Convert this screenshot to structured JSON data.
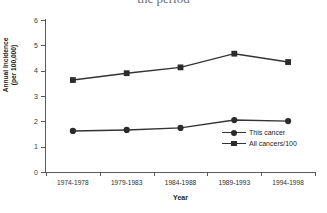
{
  "figure": {
    "title_fragment": "the period",
    "title_note": "cropped at top edge",
    "x_axis_title": "Year",
    "y_axis_title": "Annual Incidence\n(per 100,000)"
  },
  "legend": {
    "position": "inside-lower-right",
    "entries": [
      {
        "label": "This cancer",
        "marker": "circle-marker-icon"
      },
      {
        "label": "All cancers/100",
        "marker": "square-marker-icon"
      }
    ]
  },
  "colors": {
    "line": "#333333",
    "marker": "#2b2b2b",
    "axis": "#5a5a5a",
    "text": "#1c1c1c",
    "background": "#ffffff"
  },
  "chart_data": {
    "type": "line",
    "title": "the period",
    "xlabel": "Year",
    "ylabel": "Annual Incidence (per 100,000)",
    "categories": [
      "1974-1978",
      "1979-1983",
      "1984-1988",
      "1989-1993",
      "1994-1998"
    ],
    "ylim": [
      0,
      6
    ],
    "yticks": [
      0,
      1,
      2,
      3,
      4,
      5,
      6
    ],
    "ytick_labels": [
      "0",
      "1",
      "2",
      "3",
      "4",
      "5",
      "6"
    ],
    "grid": false,
    "legend_position": "inside lower right",
    "series": [
      {
        "name": "This cancer",
        "marker": "circle",
        "values": [
          1.62,
          1.66,
          1.74,
          2.05,
          2.01
        ]
      },
      {
        "name": "All cancers/100",
        "marker": "square",
        "values": [
          3.63,
          3.9,
          4.13,
          4.67,
          4.34
        ]
      }
    ]
  }
}
